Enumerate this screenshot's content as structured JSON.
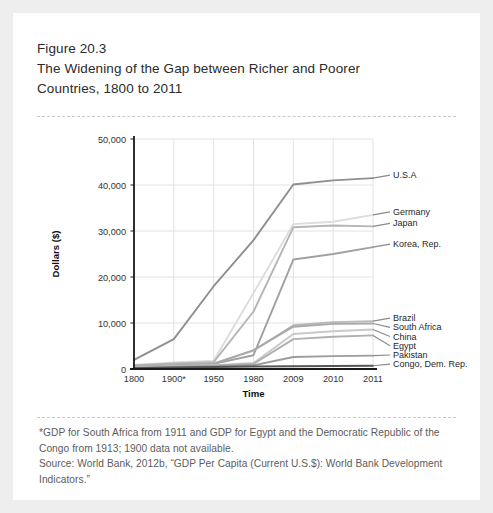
{
  "figure": {
    "number": "Figure 20.3",
    "title_line1": "The Widening of the Gap between Richer and Poorer",
    "title_line2": "Countries, 1800 to 2011"
  },
  "footnote": {
    "line1": "*GDP for South Africa from 1911 and GDP for Egypt and the Democratic Republic of the",
    "line2": "Congo from 1913; 1900 data not available.",
    "line3": "Source:  World Bank, 2012b, “GDP Per Capita (Current U.S.$): World Bank Development",
    "line4": "Indicators.”"
  },
  "colors": {
    "card_bg": "#ffffff",
    "page_bg": "#eeeeee",
    "divider": "#c9c9c9",
    "axis": "#1a1a1a",
    "grid": "#e2e2e2",
    "text": "#2b2b2b",
    "footnote_text": "#5c5c5c"
  },
  "chart_data": {
    "type": "line",
    "title": "The Widening of the Gap between Richer and Poorer Countries, 1800 to 2011",
    "xlabel": "Time",
    "ylabel": "Dollars ($)",
    "x": [
      "1800",
      "1900*",
      "1950",
      "1980",
      "2009",
      "2010",
      "2011"
    ],
    "xticklabels": [
      "1800",
      "1900*",
      "1950",
      "1980",
      "2009",
      "2010",
      "2011"
    ],
    "yticklabels": [
      "0",
      "10,000",
      "20,000",
      "30,000",
      "40,000",
      "50,000"
    ],
    "yticks": [
      0,
      10000,
      20000,
      30000,
      40000,
      50000
    ],
    "ylim": [
      0,
      50000
    ],
    "grid": true,
    "legend_position": "right-of-plot-inline-labels",
    "series": [
      {
        "name": "U.S.A",
        "color": "#8f8f8f",
        "values": [
          2000,
          6500,
          18000,
          28000,
          40100,
          41000,
          41500
        ]
      },
      {
        "name": "Germany",
        "color": "#dcdcdc",
        "values": [
          900,
          1400,
          1800,
          16500,
          31500,
          32000,
          33500
        ]
      },
      {
        "name": "Japan",
        "color": "#b5b5b5",
        "values": [
          800,
          1200,
          1500,
          12500,
          30800,
          31200,
          31000
        ]
      },
      {
        "name": "Korea, Rep.",
        "color": "#a0a0a0",
        "values": [
          600,
          900,
          1100,
          3000,
          23800,
          25000,
          26500
        ]
      },
      {
        "name": "Brazil",
        "color": "#b9b9b9",
        "values": [
          500,
          900,
          1200,
          4000,
          9500,
          10200,
          10400
        ]
      },
      {
        "name": "South Africa",
        "color": "#a8a8a8",
        "values": [
          400,
          800,
          1100,
          4100,
          9200,
          9800,
          9900
        ]
      },
      {
        "name": "China",
        "color": "#c9c9c9",
        "values": [
          350,
          600,
          800,
          1300,
          7600,
          8200,
          8600
        ]
      },
      {
        "name": "Egypt",
        "color": "#b0b0b0",
        "values": [
          300,
          550,
          700,
          1100,
          6500,
          7000,
          7300
        ]
      },
      {
        "name": "Pakistan",
        "color": "#9c9c9c",
        "values": [
          250,
          450,
          600,
          800,
          2600,
          2800,
          2900
        ]
      },
      {
        "name": "Congo, Dem. Rep.",
        "color": "#555555",
        "values": [
          200,
          350,
          450,
          550,
          600,
          650,
          700
        ]
      }
    ],
    "labels_right": [
      {
        "name": "U.S.A",
        "y_value": 41500
      },
      {
        "name": "Germany",
        "y_value": 33500
      },
      {
        "name": "Japan",
        "y_value": 31000
      },
      {
        "name": "Korea, Rep.",
        "y_value": 26500
      },
      {
        "name": "Brazil",
        "y_value": 10400
      },
      {
        "name": "South Africa",
        "y_value": 9900
      },
      {
        "name": "China",
        "y_value": 8600
      },
      {
        "name": "Egypt",
        "y_value": 7300
      },
      {
        "name": "Pakistan",
        "y_value": 2900
      },
      {
        "name": "Congo, Dem. Rep.",
        "y_value": 700
      }
    ]
  }
}
